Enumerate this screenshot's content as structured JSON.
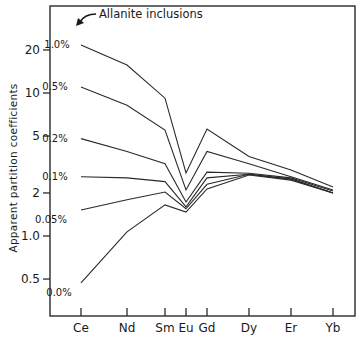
{
  "chart_data": {
    "type": "line",
    "title": "",
    "xlabel": "",
    "ylabel": "Apparent partition coefficients",
    "yscale": "log",
    "ylim": [
      0.3,
      30
    ],
    "grid": false,
    "legend": "inline labels at left end of each line",
    "categories": [
      "Ce",
      "Nd",
      "Sm",
      "Eu",
      "Gd",
      "Dy",
      "Er",
      "Yb"
    ],
    "y_ticks": [
      {
        "value": 20,
        "label": "20"
      },
      {
        "value": 10,
        "label": "10"
      },
      {
        "value": 5,
        "label": "5"
      },
      {
        "value": 2,
        "label": "2"
      },
      {
        "value": 1,
        "label": "1.0"
      },
      {
        "value": 0.5,
        "label": "0.5"
      }
    ],
    "annotations": [
      {
        "text": "Allanite inclusions",
        "arrow_to": "1.0% series label"
      }
    ],
    "series": [
      {
        "name": "1.0%",
        "values": [
          21.7,
          15.7,
          9.2,
          2.76,
          5.6,
          3.6,
          2.9,
          2.2
        ]
      },
      {
        "name": "0.5%",
        "values": [
          11.0,
          8.2,
          5.5,
          2.1,
          3.9,
          3.2,
          2.6,
          2.1
        ]
      },
      {
        "name": "0.2%",
        "values": [
          4.8,
          3.9,
          3.2,
          1.73,
          2.8,
          2.75,
          2.55,
          2.06
        ]
      },
      {
        "name": "0.1%",
        "values": [
          2.6,
          2.55,
          2.4,
          1.6,
          2.55,
          2.7,
          2.5,
          2.0
        ]
      },
      {
        "name": "0.05%",
        "values": [
          1.52,
          1.79,
          2.03,
          1.55,
          2.3,
          2.7,
          2.5,
          2.0
        ]
      },
      {
        "name": "0.0%",
        "values": [
          0.47,
          1.07,
          1.65,
          1.47,
          2.13,
          2.67,
          2.46,
          2.0
        ]
      }
    ]
  },
  "layout": {
    "plot": {
      "left": 50,
      "right": 355,
      "top": 6,
      "bottom": 316
    },
    "x_positions": [
      81,
      127,
      165,
      186,
      207,
      249,
      291,
      333
    ],
    "y_ref_value": 1,
    "y_ref_px": 236,
    "px_per_decade": 143,
    "label_offsets": [
      {
        "dx": -24,
        "dy": 0
      },
      {
        "dx": -26,
        "dy": 0
      },
      {
        "dx": -26,
        "dy": 0
      },
      {
        "dx": -26,
        "dy": 0
      },
      {
        "dx": -30,
        "dy": 10
      },
      {
        "dx": -22,
        "dy": 10
      }
    ],
    "line_color": "#2a2a2a"
  }
}
